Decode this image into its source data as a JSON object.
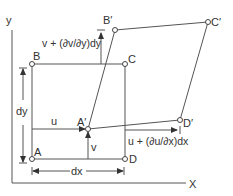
{
  "diagram": {
    "axes": {
      "y_label": "y",
      "x_label": "X"
    },
    "points": {
      "A": "A",
      "B": "B",
      "C": "C",
      "D": "D",
      "A_prime": "A′",
      "B_prime": "B′",
      "C_prime": "C′",
      "D_prime": "D′"
    },
    "dimensions": {
      "dx": "dx",
      "dy": "dy"
    },
    "velocities": {
      "u": "u",
      "v": "v",
      "v_top": "v + (∂v/∂y)dy",
      "u_right": "u + (∂u/∂x)dx"
    },
    "colors": {
      "line": "#555555",
      "text": "#333333",
      "background": "#ffffff"
    }
  }
}
